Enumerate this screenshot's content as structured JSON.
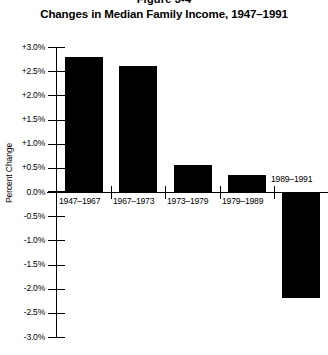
{
  "figure": {
    "number": "Figure 3-4",
    "title": "Changes in Median Family Income, 1947–1991"
  },
  "chart_data": {
    "type": "bar",
    "title": "Changes in Median Family Income, 1947–1991",
    "xlabel": "",
    "ylabel": "Percent Change",
    "ylim": [
      -3.0,
      3.0
    ],
    "ytick_step": 0.5,
    "grid": false,
    "legend": null,
    "categories": [
      "1947–1967",
      "1967–1973",
      "1973–1979",
      "1979–1989",
      "1989–1991"
    ],
    "values": [
      2.8,
      2.6,
      0.55,
      0.35,
      -2.2
    ],
    "bar_color": "#000000",
    "ytick_labels": [
      "+3.0%",
      "+2.5%",
      "+2.0%",
      "+1.5%",
      "+1.0%",
      "+0.5%",
      "0.0%",
      "-0.5%",
      "-1.0%",
      "-1.5%",
      "-2.0%",
      "-2.5%",
      "-3.0%"
    ],
    "ytick_values": [
      3.0,
      2.5,
      2.0,
      1.5,
      1.0,
      0.5,
      0.0,
      -0.5,
      -1.0,
      -1.5,
      -2.0,
      -2.5,
      -3.0
    ]
  }
}
